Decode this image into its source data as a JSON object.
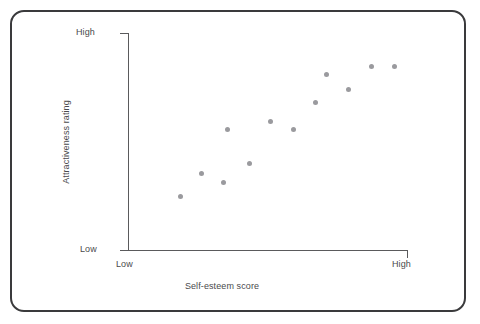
{
  "figure": {
    "title": "",
    "frame_color": "#3a3a3c",
    "axis_color": "#5a5a5c",
    "point_color": "#9a9a9e",
    "background": "#ffffff"
  },
  "axes": {
    "y_title": "Attractiveness rating",
    "x_title": "Self-esteem score",
    "y_tick_high": "High",
    "y_tick_low": "Low",
    "x_tick_low": "Low",
    "x_tick_high": "High"
  },
  "chart_data": {
    "type": "scatter",
    "title": "",
    "xlabel": "Self-esteem score",
    "ylabel": "Attractiveness rating",
    "xlim": [
      0,
      100
    ],
    "ylim": [
      0,
      100
    ],
    "xtick_labels": [
      "Low",
      "High"
    ],
    "ytick_labels": [
      "Low",
      "High"
    ],
    "grid": false,
    "legend": null,
    "annotations": [],
    "relationship": "positive correlation",
    "n_points": 12,
    "series": [
      {
        "name": "participants",
        "color": "#9a9a9e",
        "marker": "circle",
        "points": [
          {
            "x": 18,
            "y": 25
          },
          {
            "x": 26,
            "y": 36
          },
          {
            "x": 34,
            "y": 31
          },
          {
            "x": 35,
            "y": 51
          },
          {
            "x": 44,
            "y": 40
          },
          {
            "x": 51,
            "y": 59
          },
          {
            "x": 59,
            "y": 55
          },
          {
            "x": 67,
            "y": 68
          },
          {
            "x": 71,
            "y": 81
          },
          {
            "x": 78,
            "y": 74
          },
          {
            "x": 86,
            "y": 85
          },
          {
            "x": 94,
            "y": 85
          }
        ],
        "pixel_points": [
          {
            "px": 180,
            "py": 196
          },
          {
            "px": 201,
            "py": 173
          },
          {
            "px": 223,
            "py": 182
          },
          {
            "px": 227,
            "py": 129
          },
          {
            "px": 249,
            "py": 163
          },
          {
            "px": 270,
            "py": 121
          },
          {
            "px": 293,
            "py": 129
          },
          {
            "px": 315,
            "py": 102
          },
          {
            "px": 326,
            "py": 74
          },
          {
            "px": 348,
            "py": 89
          },
          {
            "px": 371,
            "py": 66
          },
          {
            "px": 394,
            "py": 66
          }
        ]
      }
    ]
  }
}
